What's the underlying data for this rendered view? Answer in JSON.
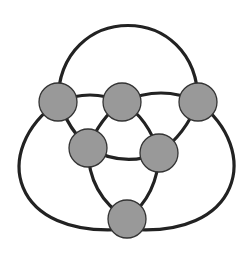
{
  "diagram": {
    "type": "graph",
    "colors": {
      "background": "#ffffff",
      "edge": "#222222",
      "node_fill": "#999999",
      "node_stroke": "#333333"
    },
    "node_radius": 19,
    "nodes": [
      {
        "id": "n1",
        "cx": 58,
        "cy": 102
      },
      {
        "id": "n2",
        "cx": 122,
        "cy": 102
      },
      {
        "id": "n3",
        "cx": 198,
        "cy": 102
      },
      {
        "id": "n4",
        "cx": 88,
        "cy": 148
      },
      {
        "id": "n5",
        "cx": 159,
        "cy": 153
      },
      {
        "id": "n6",
        "cx": 127,
        "cy": 219
      }
    ],
    "edges": [
      {
        "id": "e-n1-n3-top-arc",
        "d": "M 58 102 C 58 0, 198 0, 198 102"
      },
      {
        "id": "e-n1-n2",
        "d": "M 58 102 Q 90 88, 122 102"
      },
      {
        "id": "e-n2-n3",
        "d": "M 122 102 Q 162 84, 198 102"
      },
      {
        "id": "e-n1-n4",
        "d": "M 58 102 Q 70 130, 88 148"
      },
      {
        "id": "e-n2-n4",
        "d": "M 122 102 Q 100 118, 88 148"
      },
      {
        "id": "e-n2-n5",
        "d": "M 122 102 Q 148 118, 159 153"
      },
      {
        "id": "e-n3-n5",
        "d": "M 198 102 Q 185 135, 159 153"
      },
      {
        "id": "e-n4-n5",
        "d": "M 88 148 Q 124 168, 159 153"
      },
      {
        "id": "e-n4-n6",
        "d": "M 88 148 Q 88 195, 127 219"
      },
      {
        "id": "e-n5-n6",
        "d": "M 159 153 Q 158 195, 127 219"
      },
      {
        "id": "e-n1-n6-outer-left",
        "d": "M 58 102 C -10 150, 10 240, 127 229"
      },
      {
        "id": "e-n3-n6-outer-right",
        "d": "M 198 102 C 262 150, 242 240, 127 229"
      }
    ]
  }
}
